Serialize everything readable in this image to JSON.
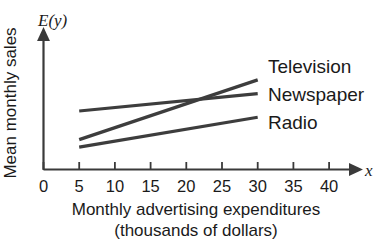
{
  "chart_data": {
    "type": "line",
    "title": "",
    "xlabel": "Monthly advertising expenditures",
    "xlabel_line2": "(thousands of dollars)",
    "ylabel": "Mean monthly sales",
    "y_axis_variable": "E(y)",
    "x_axis_variable": "x",
    "xlim": [
      0,
      44
    ],
    "ylim": [
      0,
      100
    ],
    "x_ticks": [
      0,
      5,
      10,
      15,
      20,
      25,
      30,
      35,
      40
    ],
    "x_tick_labels": [
      "0",
      "5",
      "10",
      "15",
      "20",
      "25",
      "30",
      "35",
      "40"
    ],
    "y_ticks": [],
    "y_tick_labels": [],
    "grid": false,
    "legend_position": "right-inline-end-of-line",
    "annotations": [
      "Television and Newspaper lines intersect near x = 21"
    ],
    "series": [
      {
        "name": "Television",
        "label": "Television",
        "color": "#3d3d3d",
        "x": [
          5,
          30
        ],
        "values": [
          24,
          72
        ]
      },
      {
        "name": "Newspaper",
        "label": "Newspaper",
        "color": "#3d3d3d",
        "x": [
          5,
          30
        ],
        "values": [
          47,
          61
        ]
      },
      {
        "name": "Radio",
        "label": "Radio",
        "color": "#3d3d3d",
        "x": [
          5,
          30
        ],
        "values": [
          18,
          42
        ]
      }
    ]
  }
}
